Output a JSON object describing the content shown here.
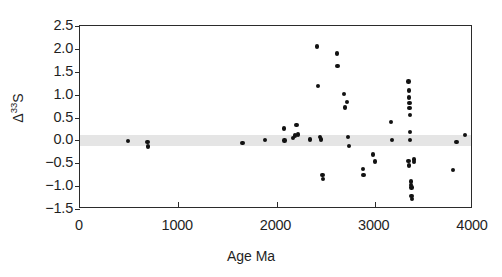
{
  "chart_data": {
    "type": "scatter",
    "title": "",
    "xlabel": "Age Ma",
    "ylabel": "Δ 33 S",
    "ylabel_base": "Δ",
    "ylabel_super": "33",
    "ylabel_tail": "S",
    "xlim": [
      0,
      4000
    ],
    "ylim": [
      -1.5,
      2.5
    ],
    "xticks": [
      0,
      1000,
      2000,
      3000,
      4000
    ],
    "xticklabels": [
      "0",
      "1000",
      "2000",
      "3000",
      "4000"
    ],
    "yticks": [
      -1.5,
      -1.0,
      -0.5,
      0.0,
      0.5,
      1.0,
      1.5,
      2.0,
      2.5
    ],
    "yticklabels": [
      "−1.5",
      "−1.0",
      "−0.5",
      "0.0",
      "0.5",
      "1.0",
      "1.5",
      "2.0",
      "2.5"
    ],
    "grid": false,
    "legend": null,
    "marker": "filled-circle",
    "marker_color": "#121212",
    "frame_color": "#2b2b2b",
    "annotations": [
      {
        "name": "zero-reference-band",
        "kind": "horizontal-band",
        "y_center": 0.0,
        "y_min": -0.12,
        "y_max": 0.12,
        "color": "#e3e3e3"
      }
    ],
    "series": [
      {
        "name": "Delta-33S samples",
        "color": "#121212",
        "points": [
          [
            490,
            -0.02
          ],
          [
            688,
            -0.04
          ],
          [
            692,
            -0.13
          ],
          [
            1655,
            -0.06
          ],
          [
            1885,
            0.01
          ],
          [
            2075,
            0.26
          ],
          [
            2080,
            0.0
          ],
          [
            2170,
            0.05
          ],
          [
            2190,
            0.11
          ],
          [
            2205,
            0.33
          ],
          [
            2220,
            0.13
          ],
          [
            2340,
            0.02
          ],
          [
            2415,
            2.05
          ],
          [
            2420,
            1.19
          ],
          [
            2445,
            0.08
          ],
          [
            2450,
            0.02
          ],
          [
            2470,
            -0.76
          ],
          [
            2472,
            -0.85
          ],
          [
            2615,
            1.9
          ],
          [
            2620,
            1.62
          ],
          [
            2690,
            1.02
          ],
          [
            2700,
            0.72
          ],
          [
            2715,
            0.84
          ],
          [
            2730,
            0.07
          ],
          [
            2740,
            -0.12
          ],
          [
            2880,
            -0.63
          ],
          [
            2885,
            -0.75
          ],
          [
            2985,
            -0.31
          ],
          [
            3000,
            -0.46
          ],
          [
            3165,
            0.4
          ],
          [
            3175,
            0.01
          ],
          [
            3345,
            1.29
          ],
          [
            3348,
            1.09
          ],
          [
            3350,
            0.94
          ],
          [
            3352,
            0.82
          ],
          [
            3354,
            0.71
          ],
          [
            3356,
            0.56
          ],
          [
            3358,
            0.18
          ],
          [
            3360,
            0.01
          ],
          [
            3345,
            -0.45
          ],
          [
            3348,
            -0.55
          ],
          [
            3400,
            -0.42
          ],
          [
            3402,
            -0.47
          ],
          [
            3368,
            -0.9
          ],
          [
            3370,
            -0.97
          ],
          [
            3372,
            -1.03
          ],
          [
            3374,
            -1.22
          ],
          [
            3376,
            -1.28
          ],
          [
            3795,
            -0.65
          ],
          [
            3830,
            -0.04
          ],
          [
            3920,
            0.12
          ]
        ]
      }
    ]
  }
}
